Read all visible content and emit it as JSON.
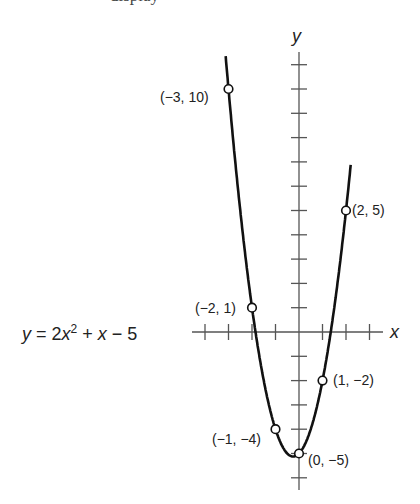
{
  "header_fragment": "display",
  "equation": {
    "y": "y",
    "eq": " = 2",
    "x": "x",
    "sup": "2",
    "plus": " + ",
    "x2": "x",
    "tail": " − 5"
  },
  "axes": {
    "x_label": "x",
    "y_label": "y"
  },
  "points": [
    {
      "x": -3,
      "y": 10,
      "label": "(−3, 10)"
    },
    {
      "x": -2,
      "y": 1,
      "label": "(−2, 1)"
    },
    {
      "x": -1,
      "y": -4,
      "label": "(−1, −4)"
    },
    {
      "x": 0,
      "y": -5,
      "label": "(0, −5)"
    },
    {
      "x": 1,
      "y": -2,
      "label": "(1, −2)"
    },
    {
      "x": 2,
      "y": 5,
      "label": "(2, 5)"
    }
  ],
  "chart_data": {
    "type": "line",
    "function": "y = 2x^2 + x - 5",
    "xlabel": "x",
    "ylabel": "y",
    "x": [
      -3,
      -2,
      -1,
      0,
      1,
      2
    ],
    "series": [
      {
        "name": "y = 2x^2 + x - 5",
        "values": [
          10,
          1,
          -4,
          -5,
          -2,
          5
        ]
      }
    ],
    "xlim": [
      -4.5,
      3.6
    ],
    "ylim": [
      -6.5,
      11.3
    ],
    "x_ticks": [
      -4,
      -3,
      -2,
      -1,
      1,
      2,
      3
    ],
    "y_ticks": [
      -6,
      -5,
      -4,
      -3,
      -2,
      -1,
      1,
      2,
      3,
      4,
      5,
      6,
      7,
      8,
      9,
      10,
      11
    ],
    "grid": false,
    "annotations": [
      "(-3, 10)",
      "(-2, 1)",
      "(-1, -4)",
      "(0, -5)",
      "(1, -2)",
      "(2, 5)"
    ]
  }
}
